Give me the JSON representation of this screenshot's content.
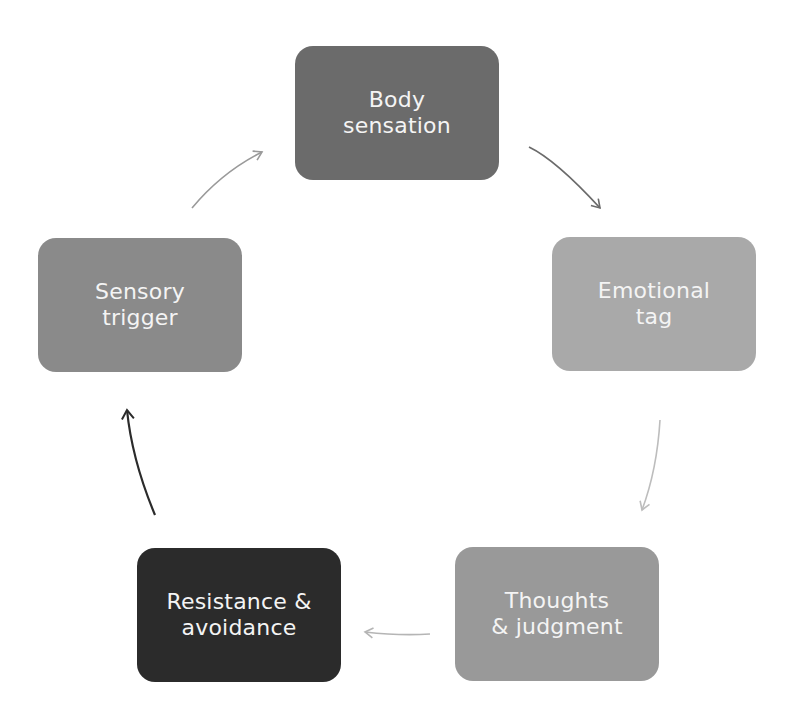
{
  "diagram": {
    "type": "cycle",
    "nodes": [
      {
        "id": "body-sensation",
        "line1": "Body",
        "line2": "sensation",
        "color": "#6b6b6b"
      },
      {
        "id": "emotional-tag",
        "line1": "Emotional",
        "line2": "tag",
        "color": "#a9a9a9"
      },
      {
        "id": "thoughts-judgment",
        "line1": "Thoughts",
        "line2": "& judgment",
        "color": "#999999"
      },
      {
        "id": "resistance-avoidance",
        "line1": "Resistance &",
        "line2": "avoidance",
        "color": "#2b2b2b"
      },
      {
        "id": "sensory-trigger",
        "line1": "Sensory",
        "line2": "trigger",
        "color": "#8a8a8a"
      }
    ],
    "edges": [
      {
        "from": "body-sensation",
        "to": "emotional-tag",
        "color": "#6b6b6b"
      },
      {
        "from": "emotional-tag",
        "to": "thoughts-judgment",
        "color": "#bdbdbd"
      },
      {
        "from": "thoughts-judgment",
        "to": "resistance-avoidance",
        "color": "#b5b5b5"
      },
      {
        "from": "resistance-avoidance",
        "to": "sensory-trigger",
        "color": "#2b2b2b"
      },
      {
        "from": "sensory-trigger",
        "to": "body-sensation",
        "color": "#9a9a9a"
      }
    ]
  }
}
